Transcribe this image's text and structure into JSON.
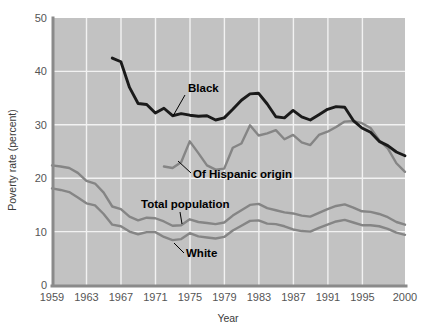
{
  "chart_data": {
    "type": "line",
    "title": "",
    "xlabel": "Year",
    "ylabel": "Poverty rate (percent)",
    "xlim": [
      1959,
      2000
    ],
    "ylim": [
      0,
      50
    ],
    "yticks": [
      0,
      10,
      20,
      30,
      40,
      50
    ],
    "xticks": [
      1959,
      1963,
      1967,
      1971,
      1975,
      1979,
      1983,
      1987,
      1991,
      1995,
      2000
    ],
    "grid": true,
    "legend_position": "inline-annotations",
    "series": [
      {
        "name": "Black",
        "color": "#1a1a1a",
        "x": [
          1966,
          1967,
          1968,
          1969,
          1970,
          1971,
          1972,
          1973,
          1974,
          1975,
          1976,
          1977,
          1978,
          1979,
          1980,
          1981,
          1982,
          1983,
          1984,
          1985,
          1986,
          1987,
          1988,
          1989,
          1990,
          1991,
          1992,
          1993,
          1994,
          1995,
          1996,
          1997,
          1998,
          1999,
          2000
        ],
        "values": [
          42.5,
          41.8,
          37.0,
          34.0,
          33.8,
          32.2,
          33.1,
          31.7,
          32.1,
          31.8,
          31.6,
          31.7,
          30.9,
          31.3,
          32.9,
          34.6,
          35.8,
          35.9,
          33.9,
          31.5,
          31.3,
          32.7,
          31.5,
          30.9,
          31.9,
          32.9,
          33.4,
          33.3,
          30.8,
          29.4,
          28.6,
          26.9,
          26.1,
          24.9,
          24.2
        ]
      },
      {
        "name": "Of Hispanic origin",
        "color": "#858585",
        "x": [
          1972,
          1973,
          1974,
          1975,
          1976,
          1977,
          1978,
          1979,
          1980,
          1981,
          1982,
          1983,
          1984,
          1985,
          1986,
          1987,
          1988,
          1989,
          1990,
          1991,
          1992,
          1993,
          1994,
          1995,
          1996,
          1997,
          1998,
          1999,
          2000
        ],
        "values": [
          22.2,
          21.9,
          23.0,
          26.9,
          24.7,
          22.4,
          21.6,
          21.8,
          25.7,
          26.5,
          29.9,
          28.0,
          28.4,
          29.0,
          27.3,
          28.1,
          26.7,
          26.2,
          28.1,
          28.7,
          29.6,
          30.6,
          30.7,
          30.3,
          29.4,
          27.1,
          25.6,
          22.8,
          21.2
        ]
      },
      {
        "name": "Total population",
        "color": "#858585",
        "x": [
          1959,
          1960,
          1961,
          1962,
          1963,
          1964,
          1965,
          1966,
          1967,
          1968,
          1969,
          1970,
          1971,
          1972,
          1973,
          1974,
          1975,
          1976,
          1977,
          1978,
          1979,
          1980,
          1981,
          1982,
          1983,
          1984,
          1985,
          1986,
          1987,
          1988,
          1989,
          1990,
          1991,
          1992,
          1993,
          1994,
          1995,
          1996,
          1997,
          1998,
          1999,
          2000
        ],
        "values": [
          22.4,
          22.2,
          21.9,
          21.0,
          19.5,
          19.0,
          17.3,
          14.7,
          14.2,
          12.8,
          12.1,
          12.6,
          12.5,
          11.9,
          11.1,
          11.2,
          12.3,
          11.8,
          11.6,
          11.4,
          11.7,
          13.0,
          14.0,
          15.0,
          15.2,
          14.4,
          14.0,
          13.6,
          13.4,
          13.0,
          12.8,
          13.5,
          14.2,
          14.8,
          15.1,
          14.5,
          13.8,
          13.7,
          13.3,
          12.7,
          11.8,
          11.3
        ]
      },
      {
        "name": "White",
        "color": "#858585",
        "x": [
          1959,
          1960,
          1961,
          1962,
          1963,
          1964,
          1965,
          1966,
          1967,
          1968,
          1969,
          1970,
          1971,
          1972,
          1973,
          1974,
          1975,
          1976,
          1977,
          1978,
          1979,
          1980,
          1981,
          1982,
          1983,
          1984,
          1985,
          1986,
          1987,
          1988,
          1989,
          1990,
          1991,
          1992,
          1993,
          1994,
          1995,
          1996,
          1997,
          1998,
          1999,
          2000
        ],
        "values": [
          18.1,
          17.8,
          17.4,
          16.4,
          15.3,
          14.9,
          13.3,
          11.3,
          11.0,
          10.0,
          9.5,
          9.9,
          9.9,
          9.0,
          8.4,
          8.6,
          9.7,
          9.1,
          8.9,
          8.7,
          9.0,
          10.2,
          11.1,
          12.0,
          12.1,
          11.5,
          11.4,
          11.0,
          10.4,
          10.1,
          10.0,
          10.7,
          11.3,
          11.9,
          12.2,
          11.7,
          11.2,
          11.2,
          11.0,
          10.5,
          9.8,
          9.4
        ]
      }
    ],
    "annotations": [
      {
        "label": "Black",
        "x": 188,
        "y": 92
      },
      {
        "label": "Of Hispanic origin",
        "x": 193,
        "y": 178
      },
      {
        "label": "Total population",
        "x": 141,
        "y": 208
      },
      {
        "label": "White",
        "x": 186,
        "y": 257
      }
    ]
  },
  "axes": {
    "y_label": "Poverty rate (percent)",
    "x_label": "Year",
    "y_ticks": [
      "0",
      "10",
      "20",
      "30",
      "40",
      "50"
    ],
    "x_ticks": [
      "1959",
      "1963",
      "1967",
      "1971",
      "1975",
      "1979",
      "1983",
      "1987",
      "1991",
      "1995",
      "2000"
    ]
  },
  "colors": {
    "plot_background": "#c2c2c2",
    "gridline": "#f2f2f2",
    "axis": "#8a8a8a",
    "black_series": "#1a1a1a",
    "gray_series": "#858585",
    "tick_text": "#555555",
    "label_text": "#3b3b3b"
  }
}
